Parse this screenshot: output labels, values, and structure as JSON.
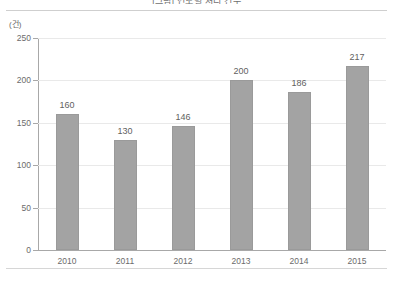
{
  "chart_data": {
    "type": "bar",
    "title": "[그림] 연도별 처리 건수",
    "categories": [
      "2010",
      "2011",
      "2012",
      "2013",
      "2014",
      "2015"
    ],
    "values": [
      160,
      130,
      146,
      200,
      186,
      217
    ],
    "series": [
      {
        "name": "건수",
        "values": [
          160,
          130,
          146,
          200,
          186,
          217
        ]
      }
    ],
    "xlabel": "",
    "ylabel": "(건)",
    "unit": "(건)",
    "ylim": [
      0,
      250
    ],
    "yticks": [
      0,
      50,
      100,
      150,
      200,
      250
    ],
    "ytick_labels": [
      "0",
      "50",
      "100",
      "150",
      "200",
      "250"
    ],
    "grid": true,
    "legend": false,
    "legend_position": "none",
    "bar_color": "#a3a3a3",
    "bar_edge_color": "#9a9a9a",
    "gridline_color": "#e9e9e9",
    "axis_color": "#a8a8a8",
    "text_color": "#6b6b6b",
    "data_labels": [
      "160",
      "130",
      "146",
      "200",
      "186",
      "217"
    ]
  }
}
